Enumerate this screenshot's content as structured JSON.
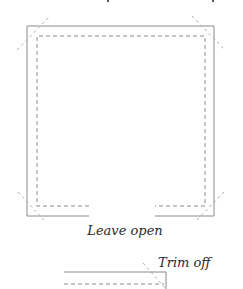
{
  "diagram": {
    "type": "sewing-pattern",
    "colors": {
      "solid_line": "#8a8a8a",
      "dashed_line": "#8a8a8a",
      "diagonal_guides": "#b0b0b0",
      "text": "#2a2a2a"
    },
    "square": {
      "label": "Leave open",
      "outer_rect": {
        "x1": 27,
        "y1": 26,
        "x2": 214,
        "y2": 216
      },
      "inner_dashed_rect": {
        "x1": 37,
        "y1": 36,
        "x2": 205,
        "y2": 206
      },
      "opening_gap": {
        "x1": 89,
        "x2": 155
      }
    },
    "trim_detail": {
      "label": "Trim off"
    }
  }
}
